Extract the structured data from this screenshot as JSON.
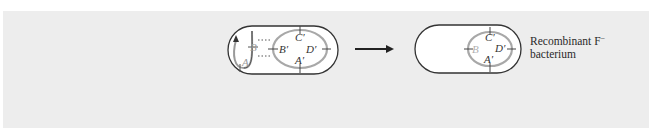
{
  "figure": {
    "background_color": "#ededed",
    "left_cell": {
      "name": "recipient cell during recombination",
      "donor_strand_labels": [
        "A",
        "B"
      ],
      "chromosome_labels": [
        "A'",
        "B'",
        "C'",
        "D'"
      ],
      "donor_color": "#9a9a9a",
      "chromosome_color": "#a8a8a8",
      "outline_color": "#333333"
    },
    "arrow": {
      "direction": "right"
    },
    "right_cell": {
      "name": "recombinant cell",
      "chromosome_labels": [
        "B",
        "C'",
        "D'",
        "A'"
      ],
      "gray_label_color": "#b0b0b0"
    },
    "caption": {
      "line1": "Recombinant F",
      "superscript": "−",
      "line2": "bacterium"
    }
  }
}
